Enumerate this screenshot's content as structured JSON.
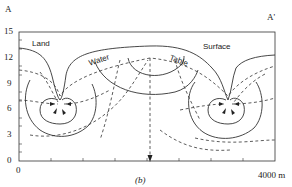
{
  "figure": {
    "section_start_label": "A",
    "section_end_label": "A'",
    "caption": "(b)",
    "annotations": {
      "land": "Land",
      "surface": "Surface",
      "water": "Water",
      "table": "Table"
    },
    "y_axis": {
      "ticks": [
        "15",
        "12",
        "9",
        "6",
        "3",
        "0"
      ],
      "range": [
        0,
        15
      ]
    },
    "x_axis": {
      "start_label": "0",
      "end_label": "4000 m",
      "range": [
        0,
        4000
      ]
    },
    "legend_semantics": {
      "solid_lines": "equipotential lines / land surface",
      "dashed_lines": "flow lines / water table"
    },
    "colors": {
      "line": "#333333",
      "background": "#ffffff"
    }
  }
}
